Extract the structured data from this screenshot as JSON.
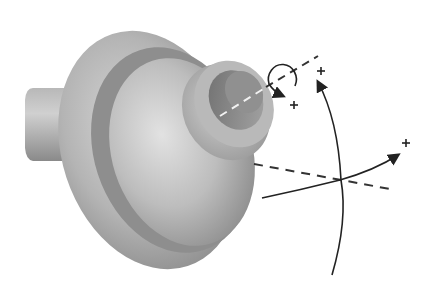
{
  "figure": {
    "type": "3D CAD part with rotation axes",
    "colors": {
      "background": "#ffffff",
      "part_light": "#d4d4d4",
      "part_mid": "#a8a8a8",
      "part_dark": "#7a7a7a",
      "line": "#333333"
    },
    "markers": [
      {
        "symbol": "+",
        "x": 294,
        "y": 108
      },
      {
        "symbol": "+",
        "x": 321,
        "y": 71
      },
      {
        "symbol": "+",
        "x": 406,
        "y": 143
      }
    ],
    "axes": [
      {
        "name": "part-axis",
        "style": "dashed"
      },
      {
        "name": "horizontal-axis",
        "style": "dashed"
      },
      {
        "name": "vertical-rotation-arc",
        "style": "solid-arrow"
      },
      {
        "name": "horizontal-rotation-arc",
        "style": "solid-arrow"
      },
      {
        "name": "spin-circle",
        "style": "solid-arrow"
      }
    ]
  }
}
